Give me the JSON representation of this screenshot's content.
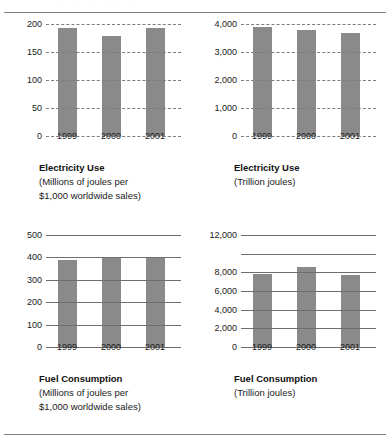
{
  "page": {
    "background_color": "#ffffff",
    "bar_color": "#8a8a8a",
    "rule_color": "#808080",
    "clip_remnant": ". .  .   ..    ."
  },
  "chart_data": [
    {
      "id": "electricity-use-intensity",
      "type": "bar",
      "position": "top-left",
      "title": "Electricity Use",
      "subtitle_lines": [
        "(Millions of joules per",
        "$1,000 worldwide sales)"
      ],
      "xlabel": "",
      "ylabel": "",
      "categories": [
        "1999",
        "2000",
        "2001"
      ],
      "values": [
        193,
        178,
        193
      ],
      "ylim": [
        0,
        200
      ],
      "yticks": [
        0,
        50,
        100,
        150,
        200
      ],
      "ytick_labels": [
        "0",
        "50",
        "100",
        "150",
        "200"
      ],
      "grid": "dashed",
      "legend": "none"
    },
    {
      "id": "electricity-use-absolute",
      "type": "bar",
      "position": "top-right",
      "title": "Electricity Use",
      "subtitle_lines": [
        "(Trillion joules)"
      ],
      "xlabel": "",
      "ylabel": "",
      "categories": [
        "1999",
        "2000",
        "2001"
      ],
      "values": [
        3900,
        3780,
        3680
      ],
      "ylim": [
        0,
        4000
      ],
      "yticks": [
        0,
        1000,
        2000,
        3000,
        4000
      ],
      "ytick_labels": [
        "0",
        "1,000",
        "2,000",
        "3,000",
        "4,000"
      ],
      "grid": "dashed",
      "legend": "none"
    },
    {
      "id": "fuel-consumption-intensity",
      "type": "bar",
      "position": "bottom-left",
      "title": "Fuel Consumption",
      "subtitle_lines": [
        "(Millions of joules per",
        "$1,000 worldwide sales)"
      ],
      "xlabel": "",
      "ylabel": "",
      "categories": [
        "1999",
        "2000",
        "2001"
      ],
      "values": [
        387,
        400,
        400
      ],
      "ylim": [
        0,
        500
      ],
      "yticks": [
        0,
        100,
        200,
        300,
        400,
        500
      ],
      "ytick_labels": [
        "0",
        "100",
        "200",
        "300",
        "400",
        "500"
      ],
      "grid": "solid",
      "legend": "none"
    },
    {
      "id": "fuel-consumption-absolute",
      "type": "bar",
      "position": "bottom-right",
      "title": "Fuel Consumption",
      "subtitle_lines": [
        "(Trillion joules)"
      ],
      "xlabel": "",
      "ylabel": "",
      "categories": [
        "1999",
        "2000",
        "2001"
      ],
      "values": [
        7850,
        8600,
        7700
      ],
      "ylim": [
        0,
        12000
      ],
      "yticks": [
        0,
        2000,
        4000,
        6000,
        8000,
        10000,
        12000
      ],
      "ytick_labels": [
        "0",
        "2,000",
        "4,000",
        "6,000",
        "8,000",
        "",
        "12,000"
      ],
      "grid": "solid",
      "legend": "none"
    }
  ]
}
